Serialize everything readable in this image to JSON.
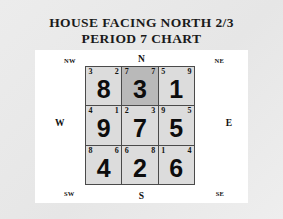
{
  "title": {
    "line1": "HOUSE FACING NORTH 2/3",
    "line2": "PERIOD 7 CHART"
  },
  "compass": {
    "nw": "NW",
    "n": "N",
    "ne": "NE",
    "w": "W",
    "e": "E",
    "sw": "SW",
    "s": "S",
    "se": "SE"
  },
  "colors": {
    "frame": "#e9e9e9",
    "panel": "#ffffff",
    "cell": "#dcdcdc",
    "cell_shaded": "#b9b9b9",
    "grid_line": "#4a4a4a",
    "text": "#111111"
  },
  "chart_data": {
    "type": "table",
    "title": "HOUSE FACING NORTH 2/3 PERIOD 7 CHART",
    "rows": 3,
    "columns": 3,
    "cell_fields": [
      "mountain_star",
      "water_star",
      "base_star"
    ],
    "cells": [
      {
        "row": 0,
        "col": 0,
        "direction": "NW",
        "mountain_star": "3",
        "water_star": "2",
        "base_star": "8",
        "shaded": false
      },
      {
        "row": 0,
        "col": 1,
        "direction": "N",
        "mountain_star": "7",
        "water_star": "7",
        "base_star": "3",
        "shaded": true
      },
      {
        "row": 0,
        "col": 2,
        "direction": "NE",
        "mountain_star": "5",
        "water_star": "9",
        "base_star": "1",
        "shaded": false
      },
      {
        "row": 1,
        "col": 0,
        "direction": "W",
        "mountain_star": "4",
        "water_star": "1",
        "base_star": "9",
        "shaded": false
      },
      {
        "row": 1,
        "col": 1,
        "direction": "Center",
        "mountain_star": "2",
        "water_star": "3",
        "base_star": "7",
        "shaded": false
      },
      {
        "row": 1,
        "col": 2,
        "direction": "E",
        "mountain_star": "9",
        "water_star": "5",
        "base_star": "5",
        "shaded": false
      },
      {
        "row": 2,
        "col": 0,
        "direction": "SW",
        "mountain_star": "8",
        "water_star": "6",
        "base_star": "4",
        "shaded": false
      },
      {
        "row": 2,
        "col": 1,
        "direction": "S",
        "mountain_star": "6",
        "water_star": "8",
        "base_star": "2",
        "shaded": false
      },
      {
        "row": 2,
        "col": 2,
        "direction": "SE",
        "mountain_star": "1",
        "water_star": "4",
        "base_star": "6",
        "shaded": false
      }
    ]
  }
}
